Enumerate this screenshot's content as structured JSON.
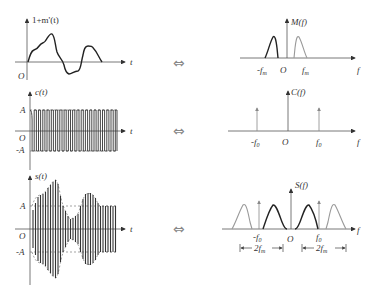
{
  "figure": {
    "rows": [
      {
        "time": {
          "ylabel": "1+m'(t)",
          "xlabel": "t",
          "origin": "O"
        },
        "arrow": "⇔",
        "freq": {
          "ylabel": "M(f)",
          "xlabel": "f",
          "origin": "O",
          "ticks": [
            "-f",
            "f"
          ],
          "tick_sub": "m"
        }
      },
      {
        "time": {
          "ylabel": "c(t)",
          "xlabel": "t",
          "origin": "O",
          "levels": [
            "A",
            "-A"
          ]
        },
        "arrow": "⇔",
        "freq": {
          "ylabel": "C(f)",
          "xlabel": "f",
          "origin": "O",
          "ticks": [
            "-f",
            "f"
          ],
          "tick_sub": "0"
        }
      },
      {
        "time": {
          "ylabel": "s(t)",
          "xlabel": "t",
          "origin": "O",
          "levels": [
            "A",
            "-A"
          ]
        },
        "arrow": "⇔",
        "freq": {
          "ylabel": "S(f)",
          "xlabel": "f",
          "origin": "O",
          "ticks": [
            "-f",
            "f"
          ],
          "tick_sub": "0",
          "bandwidth": "2f",
          "bandwidth_sub": "m"
        }
      }
    ]
  }
}
